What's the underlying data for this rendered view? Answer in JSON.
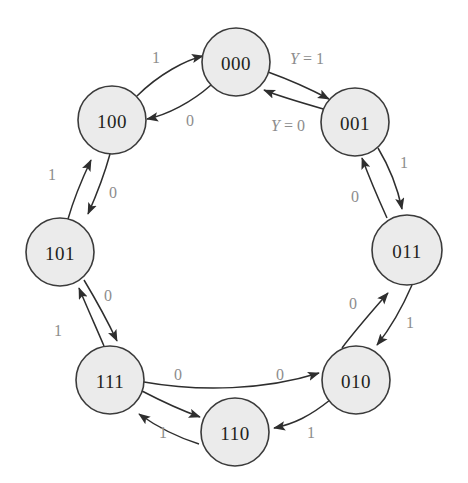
{
  "diagram": {
    "type": "state-transition-diagram",
    "background_color": "#ffffff",
    "node_fill_color": "#ebebeb",
    "node_stroke_color": "#3b3b3b",
    "edge_color": "#2e2e2e",
    "label_color": "#8d8d8d",
    "state_text_color": "#231f20",
    "states": [
      {
        "id": "s000",
        "label": "000",
        "cx": 236,
        "cy": 62,
        "r": 34
      },
      {
        "id": "s001",
        "label": "001",
        "cx": 355,
        "cy": 122,
        "r": 34
      },
      {
        "id": "s011",
        "label": "011",
        "cx": 407,
        "cy": 250,
        "r": 35
      },
      {
        "id": "s010",
        "label": "010",
        "cx": 356,
        "cy": 380,
        "r": 34
      },
      {
        "id": "s110",
        "label": "110",
        "cx": 235,
        "cy": 432,
        "r": 34
      },
      {
        "id": "s111",
        "label": "111",
        "cx": 110,
        "cy": 380,
        "r": 34
      },
      {
        "id": "s101",
        "label": "101",
        "cx": 60,
        "cy": 252,
        "r": 34
      },
      {
        "id": "s100",
        "label": "100",
        "cx": 112,
        "cy": 120,
        "r": 34
      }
    ],
    "transitions": [
      {
        "id": "t-100-000",
        "from": "100",
        "to": "000",
        "label": "1",
        "label_x": 156,
        "label_y": 57
      },
      {
        "id": "t-000-100",
        "from": "000",
        "to": "100",
        "label": "0",
        "label_x": 190,
        "label_y": 120
      },
      {
        "id": "t-000-001",
        "from": "000",
        "to": "001",
        "label": "Y = 1",
        "label_x": 307,
        "label_y": 58,
        "kind": "output"
      },
      {
        "id": "t-001-000",
        "from": "001",
        "to": "000",
        "label": "Y = 0",
        "label_x": 288,
        "label_y": 125,
        "kind": "output"
      },
      {
        "id": "t-001-011",
        "from": "001",
        "to": "011",
        "label": "1",
        "label_x": 404,
        "label_y": 162
      },
      {
        "id": "t-011-001",
        "from": "011",
        "to": "001",
        "label": "0",
        "label_x": 355,
        "label_y": 196
      },
      {
        "id": "t-010-011",
        "from": "010",
        "to": "011",
        "label": "0",
        "label_x": 353,
        "label_y": 303
      },
      {
        "id": "t-011-010",
        "from": "011",
        "to": "010",
        "label": "1",
        "label_x": 410,
        "label_y": 322
      },
      {
        "id": "t-010-110",
        "from": "010",
        "to": "110",
        "label": "1",
        "label_x": 311,
        "label_y": 432
      },
      {
        "id": "t-111-010",
        "from": "111",
        "to": "010",
        "label": "0",
        "label_x": 280,
        "label_y": 374
      },
      {
        "id": "t-111-110",
        "from": "111",
        "to": "110",
        "label": "0",
        "label_x": 178,
        "label_y": 374
      },
      {
        "id": "t-110-111",
        "from": "110",
        "to": "111",
        "label": "1",
        "label_x": 163,
        "label_y": 432
      },
      {
        "id": "t-111-101",
        "from": "111",
        "to": "101",
        "label": "1",
        "label_x": 58,
        "label_y": 330
      },
      {
        "id": "t-101-111",
        "from": "101",
        "to": "111",
        "label": "0",
        "label_x": 108,
        "label_y": 295
      },
      {
        "id": "t-101-100",
        "from": "101",
        "to": "100",
        "label": "1",
        "label_x": 52,
        "label_y": 174
      },
      {
        "id": "t-100-101",
        "from": "100",
        "to": "101",
        "label": "0",
        "label_x": 113,
        "label_y": 192
      }
    ]
  }
}
